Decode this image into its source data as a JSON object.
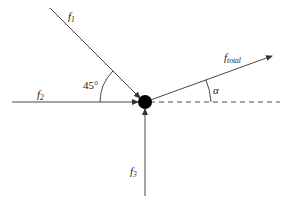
{
  "diagram": {
    "title": "",
    "vectors": [
      {
        "id": "f1",
        "label": "f",
        "subscript": "1"
      },
      {
        "id": "f2",
        "label": "f",
        "subscript": "2"
      },
      {
        "id": "f3",
        "label": "f",
        "subscript": "3"
      },
      {
        "id": "ftotal",
        "label": "f",
        "subscript": "total"
      }
    ],
    "angles": {
      "f1_angle": "45°",
      "alpha": "α"
    },
    "colors": {
      "line": "#333333",
      "dot": "#000000",
      "background": "#ffffff"
    }
  }
}
